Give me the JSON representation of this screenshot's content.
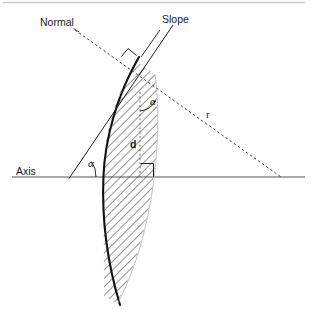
{
  "figure": {
    "background_color": "#ffffff",
    "width": 319,
    "height": 331
  },
  "colors": {
    "stroke_dark": "#1a1a1a",
    "axis_gray": "#8c8c8c",
    "top_rule": "#c9c9c9",
    "hatch": "#3a3a3a",
    "dashed": "#4d4d4d"
  },
  "labels": {
    "normal": "Normal",
    "slope": "Slope",
    "axis": "Axis",
    "alpha_upper": "α",
    "alpha_lower": "α",
    "radius": "r",
    "distance": "d"
  },
  "geometry": {
    "axis_line": {
      "x1": 12,
      "y1": 177,
      "x2": 305,
      "y2": 177
    },
    "top_rule": {
      "x1": 3,
      "y1": 2,
      "x2": 305,
      "y2": 2
    },
    "mirror_vertex": {
      "x": 103,
      "y": 177
    },
    "tangent_point": {
      "x": 136,
      "y": 63
    },
    "center_of_curvature": {
      "x": 280,
      "y": 177
    },
    "foot_point": {
      "x": 140,
      "y": 177
    },
    "slope_line": {
      "x1": 69,
      "y1": 178,
      "x2": 172,
      "y2": 26
    },
    "normal_line": {
      "x1": 74,
      "y1": 29,
      "x2": 280,
      "y2": 177
    },
    "drop_line": {
      "x": 140,
      "y1": 92,
      "y2": 177
    },
    "alpha_upper_pos": {
      "x": 152,
      "y": 104
    },
    "alpha_lower_pos": {
      "x": 89,
      "y": 167
    },
    "radius_label_pos": {
      "x": 207,
      "y": 117
    },
    "distance_label_pos": {
      "x": 131,
      "y": 147
    },
    "normal_label_pos": {
      "x": 40,
      "y": 26
    },
    "slope_label_pos": {
      "x": 162,
      "y": 23
    },
    "axis_label_pos": {
      "x": 16,
      "y": 175
    }
  },
  "annotations": {
    "right_angle_at_tangent": true,
    "right_angle_at_axis": true,
    "hatching_direction": "45-degree",
    "mirror_is_concave": true
  }
}
